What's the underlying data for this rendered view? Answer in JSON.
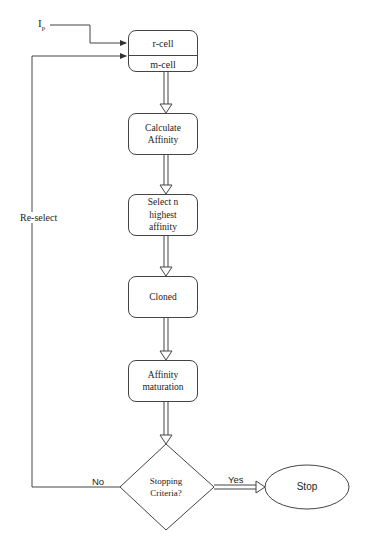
{
  "diagram": {
    "input_label": "I",
    "input_subscript": "p",
    "top_box": {
      "upper": "r-cell",
      "lower": "m-cell"
    },
    "steps": [
      {
        "line1": "Calculate",
        "line2": "Affinity"
      },
      {
        "line1": "Select n",
        "line2": "highest",
        "line3": "affinity"
      },
      {
        "line1": "Cloned"
      },
      {
        "line1": "Affinity",
        "line2": "maturation"
      }
    ],
    "decision": {
      "line1": "Stopping",
      "line2": "Criteria?"
    },
    "terminal": "Stop",
    "edges": {
      "loop_label": "Re-select",
      "no_label": "No",
      "yes_label": "Yes"
    },
    "colors": {
      "stroke": "#444444",
      "background": "#ffffff"
    }
  }
}
